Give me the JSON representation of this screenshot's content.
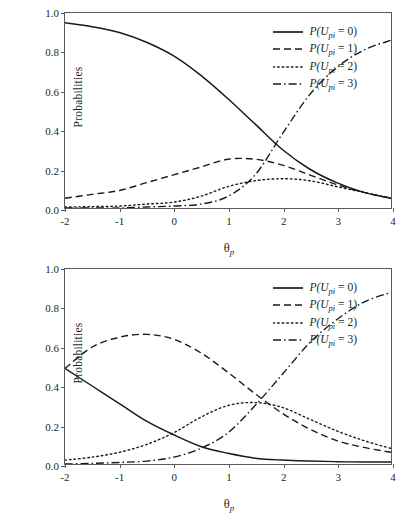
{
  "figure": {
    "panels": [
      {
        "id": "top",
        "legend_items": [
          {
            "label_prefix": "P(U",
            "label_sub": "pi",
            "label_suffix": " = 0)",
            "style": "solid"
          },
          {
            "label_prefix": "P(U",
            "label_sub": "pi",
            "label_suffix": " = 1)",
            "style": "dashed"
          },
          {
            "label_prefix": "P(U",
            "label_sub": "pi",
            "label_suffix": " = 2)",
            "style": "dotted"
          },
          {
            "label_prefix": "P(U",
            "label_sub": "pi",
            "label_suffix": " = 3)",
            "style": "dashdot"
          }
        ]
      },
      {
        "id": "bottom",
        "legend_items": [
          {
            "label_prefix": "P(U",
            "label_sub": "pi",
            "label_suffix": " = 0)",
            "style": "solid"
          },
          {
            "label_prefix": "P(U",
            "label_sub": "pi",
            "label_suffix": " = 1)",
            "style": "dashed"
          },
          {
            "label_prefix": "P(U",
            "label_sub": "pi",
            "label_suffix": " = 2)",
            "style": "dotted"
          },
          {
            "label_prefix": "P(U",
            "label_sub": "pi",
            "label_suffix": " = 3)",
            "style": "dashdot"
          }
        ]
      }
    ]
  },
  "chart_data": [
    {
      "type": "line",
      "title": "",
      "xlabel": "θ",
      "xlabel_sub": "p",
      "ylabel": "Probabilities",
      "xlim": [
        -2,
        4
      ],
      "ylim": [
        0.0,
        1.0
      ],
      "xticks": [
        -2,
        -1,
        0,
        1,
        2,
        3,
        4
      ],
      "xtick_labels": [
        "-2",
        "-1",
        "0",
        "1",
        "2",
        "3",
        "4"
      ],
      "yticks": [
        0.0,
        0.2,
        0.4,
        0.6,
        0.8,
        1.0
      ],
      "ytick_labels": [
        "0.0",
        "0.2",
        "0.4",
        "0.6",
        "0.8",
        "1.0"
      ],
      "grid": false,
      "legend_position": "top-right",
      "line_color": "#1a1a1a",
      "x": [
        -2,
        -1.5,
        -1,
        -0.5,
        0,
        0.5,
        1,
        1.5,
        2,
        2.5,
        3,
        3.5,
        4
      ],
      "series": [
        {
          "name": "P(U_pi = 0)",
          "style": "solid",
          "values": [
            0.95,
            0.93,
            0.9,
            0.85,
            0.78,
            0.68,
            0.56,
            0.43,
            0.3,
            0.2,
            0.13,
            0.08,
            0.05
          ]
        },
        {
          "name": "P(U_pi = 1)",
          "style": "dashed",
          "values": [
            0.05,
            0.07,
            0.09,
            0.13,
            0.17,
            0.21,
            0.25,
            0.25,
            0.22,
            0.17,
            0.12,
            0.08,
            0.05
          ]
        },
        {
          "name": "P(U_pi = 2)",
          "style": "dotted",
          "values": [
            0.005,
            0.007,
            0.01,
            0.02,
            0.03,
            0.06,
            0.11,
            0.14,
            0.15,
            0.14,
            0.11,
            0.08,
            0.05
          ]
        },
        {
          "name": "P(U_pi = 3)",
          "style": "dashdot",
          "values": [
            0.0,
            0.0,
            0.0,
            0.005,
            0.01,
            0.02,
            0.06,
            0.17,
            0.38,
            0.58,
            0.72,
            0.81,
            0.86
          ]
        }
      ]
    },
    {
      "type": "line",
      "title": "",
      "xlabel": "θ",
      "xlabel_sub": "p",
      "ylabel": "Probabilities",
      "xlim": [
        -2,
        4
      ],
      "ylim": [
        0.0,
        1.0
      ],
      "xticks": [
        -2,
        -1,
        0,
        1,
        2,
        3,
        4
      ],
      "xtick_labels": [
        "-2",
        "-1",
        "0",
        "1",
        "2",
        "3",
        "4"
      ],
      "yticks": [
        0.0,
        0.2,
        0.4,
        0.6,
        0.8,
        1.0
      ],
      "ytick_labels": [
        "0.0",
        "0.2",
        "0.4",
        "0.6",
        "0.8",
        "1.0"
      ],
      "grid": false,
      "legend_position": "top-right",
      "line_color": "#1a1a1a",
      "x": [
        -2,
        -1.5,
        -1,
        -0.5,
        0,
        0.5,
        1,
        1.5,
        2,
        2.5,
        3,
        3.5,
        4
      ],
      "series": [
        {
          "name": "P(U_pi = 0)",
          "style": "solid",
          "values": [
            0.49,
            0.4,
            0.31,
            0.22,
            0.15,
            0.09,
            0.055,
            0.03,
            0.02,
            0.015,
            0.012,
            0.01,
            0.01
          ]
        },
        {
          "name": "P(U_pi = 1)",
          "style": "dashed",
          "values": [
            0.49,
            0.6,
            0.65,
            0.665,
            0.64,
            0.57,
            0.47,
            0.36,
            0.26,
            0.18,
            0.12,
            0.085,
            0.06
          ]
        },
        {
          "name": "P(U_pi = 2)",
          "style": "dotted",
          "values": [
            0.02,
            0.035,
            0.06,
            0.1,
            0.16,
            0.24,
            0.3,
            0.315,
            0.29,
            0.23,
            0.17,
            0.12,
            0.08
          ]
        },
        {
          "name": "P(U_pi = 3)",
          "style": "dashdot",
          "values": [
            0.0,
            0.003,
            0.008,
            0.015,
            0.035,
            0.08,
            0.16,
            0.3,
            0.46,
            0.62,
            0.74,
            0.83,
            0.88
          ]
        }
      ]
    }
  ]
}
